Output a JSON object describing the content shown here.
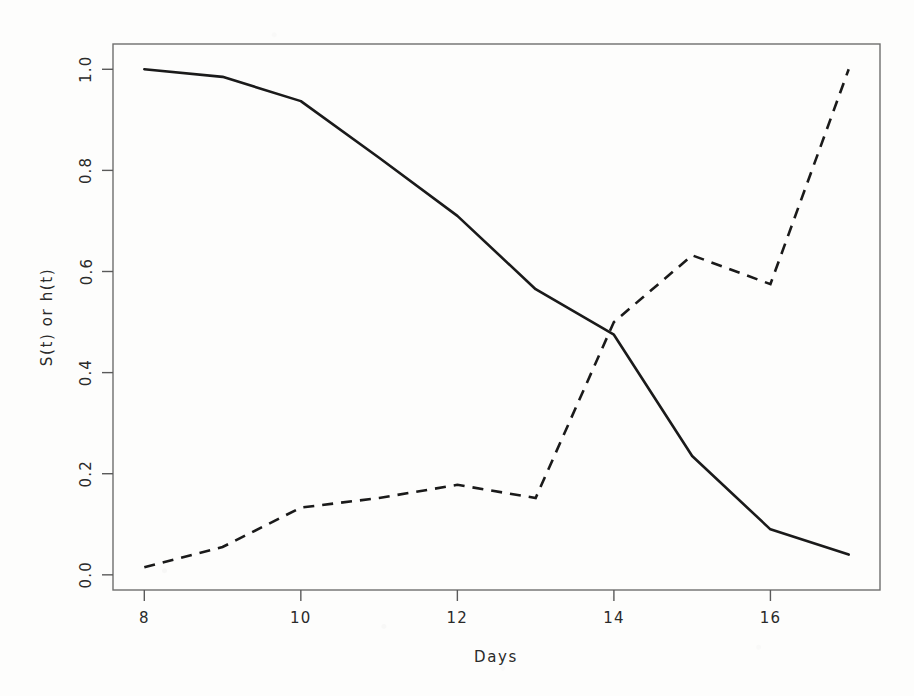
{
  "chart_data": {
    "type": "line",
    "title": "",
    "xlabel": "Days",
    "ylabel": "S(t) or h(t)",
    "xlim": [
      7.6,
      17.4
    ],
    "ylim": [
      -0.03,
      1.05
    ],
    "grid": false,
    "legend": "none",
    "x_ticks": [
      8,
      10,
      12,
      14,
      16
    ],
    "x_tick_labels": [
      "8",
      "10",
      "12",
      "14",
      "16"
    ],
    "y_ticks": [
      0.0,
      0.2,
      0.4,
      0.6,
      0.8,
      1.0
    ],
    "y_tick_labels": [
      "0.0",
      "0.2",
      "0.4",
      "0.6",
      "0.8",
      "1.0"
    ],
    "x": [
      8,
      9,
      10,
      11,
      12,
      13,
      14,
      15,
      16,
      17
    ],
    "series": [
      {
        "name": "S(t)",
        "style": "solid",
        "color": "#1a1a1a",
        "values": [
          1.0,
          0.985,
          0.937,
          0.825,
          0.71,
          0.565,
          0.475,
          0.235,
          0.09,
          0.04
        ]
      },
      {
        "name": "h(t)",
        "style": "dashed",
        "color": "#1a1a1a",
        "values": [
          0.015,
          0.055,
          0.133,
          0.152,
          0.178,
          0.152,
          0.5,
          0.632,
          0.575,
          1.0
        ]
      }
    ]
  },
  "axes": {
    "y_axis_label": "S(t) or h(t)",
    "x_axis_label": "Days"
  }
}
